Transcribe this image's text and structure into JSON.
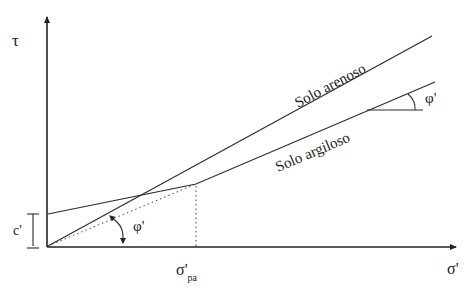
{
  "diagram": {
    "type": "mohr-coulomb-envelopes",
    "axes": {
      "y_label": "τ",
      "x_label": "σ'"
    },
    "curves": [
      {
        "name": "Solo arenoso",
        "label": "Solo arenoso",
        "description": "straight envelope through origin"
      },
      {
        "name": "Solo argiloso",
        "label": "Solo argiloso",
        "description": "bilinear envelope with intercept c' up to σ'pa, then line through origin"
      }
    ],
    "annotations": {
      "cohesion_label": "c'",
      "friction_angle_label_upper": "φ'",
      "friction_angle_label_lower": "φ'",
      "preconsolidation_label_main": "σ'",
      "preconsolidation_label_sub": "pa"
    },
    "colors": {
      "line": "#2a2a2a",
      "background": "#ffffff"
    }
  }
}
